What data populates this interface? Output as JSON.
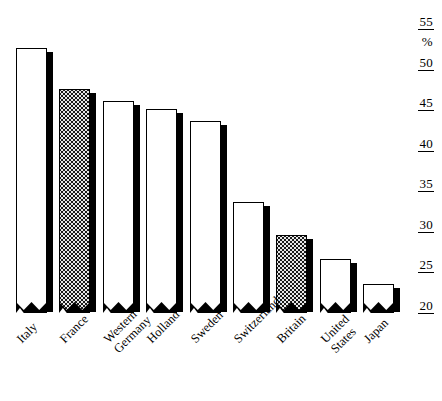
{
  "chart_data": {
    "type": "bar",
    "title": "",
    "subtitle": "",
    "xlabel": "",
    "ylabel": "%",
    "unit_label": "%",
    "ylim": [
      20,
      55
    ],
    "ytick_values": [
      55,
      50,
      45,
      40,
      35,
      30,
      25,
      20
    ],
    "ytick_labels": [
      "55",
      "50",
      "45",
      "40",
      "35",
      "30",
      "25",
      "20"
    ],
    "axis_break": true,
    "grid": false,
    "legend": "none",
    "categories": [
      "Italy",
      "France",
      "Western Germany",
      "Holland",
      "Sweden",
      "Switzerland",
      "Britain",
      "United States",
      "Japan"
    ],
    "values": [
      52.5,
      47.5,
      46.0,
      45.0,
      43.5,
      33.5,
      29.5,
      26.5,
      23.5
    ],
    "bars": [
      {
        "label": "Italy",
        "label_lines": [
          "Italy"
        ],
        "value": 52.5,
        "fill": "white"
      },
      {
        "label": "France",
        "label_lines": [
          "France"
        ],
        "value": 47.5,
        "fill": "stipple"
      },
      {
        "label": "Western Germany",
        "label_lines": [
          "Western",
          "Germany"
        ],
        "value": 46.0,
        "fill": "white"
      },
      {
        "label": "Holland",
        "label_lines": [
          "Holland"
        ],
        "value": 45.0,
        "fill": "white"
      },
      {
        "label": "Sweden",
        "label_lines": [
          "Sweden"
        ],
        "value": 43.5,
        "fill": "white"
      },
      {
        "label": "Switzerland",
        "label_lines": [
          "Switzerland"
        ],
        "value": 33.5,
        "fill": "white"
      },
      {
        "label": "Britain",
        "label_lines": [
          "Britain"
        ],
        "value": 29.5,
        "fill": "stipple"
      },
      {
        "label": "United States",
        "label_lines": [
          "United",
          "States"
        ],
        "value": 26.5,
        "fill": "white"
      },
      {
        "label": "Japan",
        "label_lines": [
          "Japan"
        ],
        "value": 23.5,
        "fill": "white"
      }
    ],
    "colors": {
      "bar_outline": "#000000",
      "bar_fill_white": "#ffffff",
      "bar_fill_stipple": "#e8e8e8",
      "shadow": "#000000",
      "text": "#000000",
      "background": "#ffffff"
    }
  }
}
